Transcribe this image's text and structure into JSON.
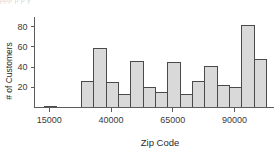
{
  "figure": {
    "top_cropped_text": "ppp p  p y",
    "background_color": "#ffffff",
    "bar_fill_color": "#d9d9d9",
    "bar_edge_color": "#4a4a4a",
    "axis_color": "#5c5c5c"
  },
  "chart_data": {
    "type": "bar",
    "title": "",
    "xlabel": "Zip Code",
    "ylabel": "# of Customers",
    "xlim": [
      9000,
      105000
    ],
    "ylim": [
      0,
      88
    ],
    "grid": false,
    "legend": null,
    "xticks": [
      15000,
      40000,
      65000,
      90000
    ],
    "xtick_labels": [
      "15000",
      "40000",
      "65000",
      "90000"
    ],
    "yticks": [
      20,
      40,
      60,
      80
    ],
    "ytick_labels": [
      "20",
      "40",
      "60",
      "80"
    ],
    "bin_width": 5000,
    "bins": [
      {
        "x0": 13000,
        "x1": 18000,
        "value": 1
      },
      {
        "x0": 28000,
        "x1": 33000,
        "value": 26
      },
      {
        "x0": 33000,
        "x1": 38000,
        "value": 58
      },
      {
        "x0": 38000,
        "x1": 43000,
        "value": 25
      },
      {
        "x0": 43000,
        "x1": 48000,
        "value": 13
      },
      {
        "x0": 48000,
        "x1": 53000,
        "value": 46
      },
      {
        "x0": 53000,
        "x1": 58000,
        "value": 20
      },
      {
        "x0": 58000,
        "x1": 63000,
        "value": 15
      },
      {
        "x0": 63000,
        "x1": 68000,
        "value": 45
      },
      {
        "x0": 68000,
        "x1": 73000,
        "value": 13
      },
      {
        "x0": 73000,
        "x1": 78000,
        "value": 26
      },
      {
        "x0": 78000,
        "x1": 83000,
        "value": 41
      },
      {
        "x0": 83000,
        "x1": 88000,
        "value": 22
      },
      {
        "x0": 88000,
        "x1": 93000,
        "value": 20
      },
      {
        "x0": 93000,
        "x1": 98000,
        "value": 81
      },
      {
        "x0": 98000,
        "x1": 103000,
        "value": 48
      }
    ],
    "categories": [
      "13000-18000",
      "28000-33000",
      "33000-38000",
      "38000-43000",
      "43000-48000",
      "48000-53000",
      "53000-58000",
      "58000-63000",
      "63000-68000",
      "68000-73000",
      "73000-78000",
      "78000-83000",
      "83000-88000",
      "88000-93000",
      "93000-98000",
      "98000-103000"
    ],
    "values": [
      1,
      26,
      58,
      25,
      13,
      46,
      20,
      15,
      45,
      13,
      26,
      41,
      22,
      20,
      81,
      48
    ]
  }
}
